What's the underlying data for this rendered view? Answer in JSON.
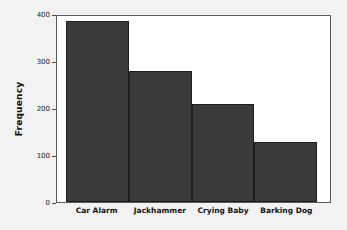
{
  "chart_data": {
    "type": "bar",
    "title": "",
    "subtitle": "",
    "xlabel": "",
    "ylabel": "Frequency",
    "categories": [
      "Car Alarm",
      "Jackhammer",
      "Crying Baby",
      "Barking Dog"
    ],
    "values": [
      386,
      278,
      208,
      128
    ],
    "ylim": [
      0,
      400
    ],
    "yticks": [
      0,
      100,
      200,
      300,
      400
    ],
    "ytick_labels": [
      "0",
      "100",
      "200",
      "300",
      "400"
    ],
    "grid": false,
    "legend": null,
    "bar_color": "#3a3a3a",
    "bar_edge_color": "#1e1e1e",
    "axis_color": "#5a5a5a",
    "plot_background": "#ffffff",
    "figure_background": "#f2f2f2",
    "bars_contiguous": true,
    "annotations": []
  }
}
